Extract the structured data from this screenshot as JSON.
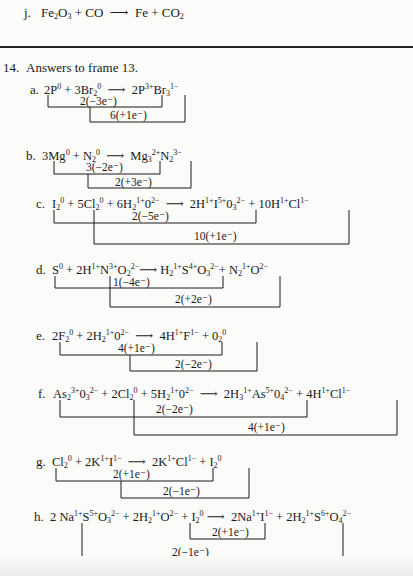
{
  "previous_item": {
    "letter": "j.",
    "equation_html": "Fe<sub>2</sub>O<sub>3</sub> + CO &nbsp;⟶&nbsp; Fe + CO<sub>2</sub>"
  },
  "section": {
    "number": "14.",
    "title": "Answers to frame 13."
  },
  "answers": [
    {
      "letter": "a.",
      "equation_html": "2P<sup>0</sup> + 3Br<sub>2</sub><sup>0</sup> &nbsp;⟶&nbsp; 2P<sup>3+</sup>Br<sub>3</sub><sup>1−</sup>",
      "brackets": [
        {
          "label": "2(−3e⁻)"
        },
        {
          "label": "6(+1e⁻)"
        }
      ]
    },
    {
      "letter": "b.",
      "equation_html": "3Mg<sup>0</sup> + N<sub>2</sub><sup>0</sup> &nbsp;⟶&nbsp; Mg<sub>3</sub><sup>2+</sup>N<sub>2</sub><sup>3−</sup>",
      "brackets": [
        {
          "label": "3(−2e⁻)"
        },
        {
          "label": "2(+3e⁻)"
        }
      ]
    },
    {
      "letter": "c.",
      "equation_html": "I<sub>2</sub><sup>0</sup> + 5Cl<sub>2</sub><sup>0</sup> + 6H<sub>2</sub><sup>1+</sup>0<sup>2−</sup> &nbsp;⟶&nbsp; 2H<sup>1+</sup>I<sup>5+</sup>0<sub>3</sub><sup>2−</sup> + 10H<sup>1+</sup>Cl<sup>1−</sup>",
      "brackets": [
        {
          "label": "2(−5e⁻)"
        },
        {
          "label": "10(+1e⁻)"
        }
      ]
    },
    {
      "letter": "d.",
      "equation_html": "S<sup>0</sup> + 2H<sup>1+</sup>N<sup>3+</sup>O<sub>2</sub><sup>2−</sup>⟶ H<sub>2</sub><sup>1+</sup>S<sup>4+</sup>O<sub>3</sub><sup>2−</sup>+ N<sub>2</sub><sup>1+</sup>O<sup>2−</sup>",
      "brackets": [
        {
          "label": "1(−4e⁻)"
        },
        {
          "label": "2(+2e⁻)"
        }
      ]
    },
    {
      "letter": "e.",
      "equation_html": "2F<sub>2</sub><sup>0</sup> + 2H<sub>2</sub><sup>1+</sup>0<sup>2−</sup> &nbsp;⟶&nbsp; 4H<sup>1+</sup>F<sup>1−</sup> + 0<sub>2</sub><sup>0</sup>",
      "brackets": [
        {
          "label": "4(+1e⁻)"
        },
        {
          "label": "2(−2e⁻)"
        }
      ]
    },
    {
      "letter": "f.",
      "equation_html": "As<sub>2</sub><sup>3+</sup>0<sub>3</sub><sup>2−</sup> + 2Cl<sub>2</sub><sup>0</sup> + 5H<sub>2</sub><sup>1+</sup>0<sup>2−</sup> &nbsp;⟶&nbsp; 2H<sub>3</sub><sup>1+</sup>As<sup>5+</sup>0<sub>4</sub><sup>2−</sup> + 4H<sup>1+</sup>Cl<sup>1−</sup>",
      "brackets": [
        {
          "label": "2(−2e⁻)"
        },
        {
          "label": "4(+1e⁻)"
        }
      ]
    },
    {
      "letter": "g.",
      "equation_html": "Cl<sub>2</sub><sup>0</sup> + 2K<sup>1+</sup>I<sup>1−</sup> &nbsp;⟶&nbsp; 2K<sup>1+</sup>Cl<sup>1−</sup> + I<sub>2</sub><sup>0</sup>",
      "brackets": [
        {
          "label": "2(+1e⁻)"
        },
        {
          "label": "2(−1e⁻)"
        }
      ]
    },
    {
      "letter": "h.",
      "equation_html": "2 Na<sup>1+</sup>S<sup>5+</sup>O<sub>3</sub><sup>2−</sup> + 2H<sub>2</sub><sup>1+</sup>O<sup>2−</sup> + I<sub>2</sub><sup>0</sup> ⟶ &nbsp;2Na<sup>1+</sup>I<sup>1−</sup> + 2H<sub>2</sub><sup>1+</sup>S<sup>6+</sup>O<sub>4</sub><sup>2−</sup>",
      "brackets": [
        {
          "label": "2(+1e⁻)"
        },
        {
          "label": "2(−1e⁻)"
        }
      ]
    }
  ]
}
